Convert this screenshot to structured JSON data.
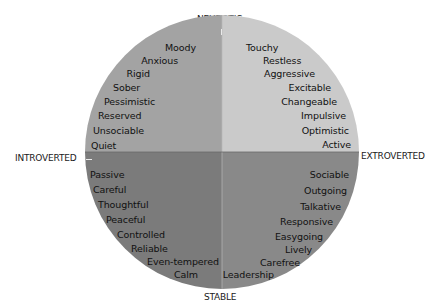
{
  "axes": {
    "top": "NEUROTIC",
    "bottom": "STABLE",
    "left": "INTROVERTED",
    "right": "EXTROVERTED"
  },
  "quadrants": {
    "neurotic_introverted": {
      "color": "#a3a3a3",
      "traits": [
        "Moody",
        "Anxious",
        "Rigid",
        "Sober",
        "Pessimistic",
        "Reserved",
        "Unsociable",
        "Quiet"
      ]
    },
    "neurotic_extroverted": {
      "color": "#cacaca",
      "traits": [
        "Touchy",
        "Restless",
        "Aggressive",
        "Excitable",
        "Changeable",
        "Impulsive",
        "Optimistic",
        "Active"
      ]
    },
    "stable_introverted": {
      "color": "#7b7b7b",
      "traits": [
        "Passive",
        "Careful",
        "Thoughtful",
        "Peaceful",
        "Controlled",
        "Reliable",
        "Even-tempered",
        "Calm"
      ]
    },
    "stable_extroverted": {
      "color": "#898989",
      "traits": [
        "Sociable",
        "Outgoing",
        "Talkative",
        "Responsive",
        "Easygoing",
        "Lively",
        "Carefree",
        "Leadership"
      ]
    }
  }
}
